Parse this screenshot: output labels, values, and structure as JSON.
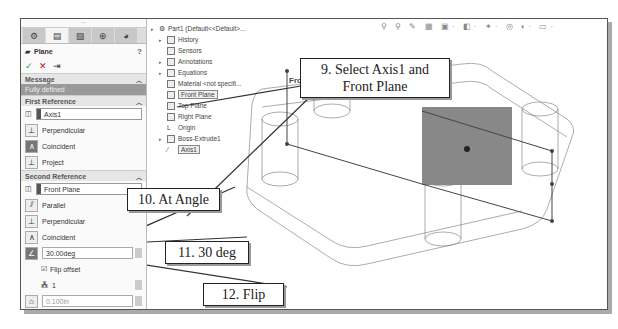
{
  "panel": {
    "tabs": [
      "feature-manager",
      "property-manager",
      "configuration-manager",
      "dimxpert",
      "display-manager"
    ],
    "title": "Plane",
    "help": "?",
    "actions": {
      "ok": "✓",
      "cancel": "✕",
      "pin": "⇥"
    },
    "message": {
      "header": "Message",
      "text": "Fully defined"
    },
    "first_reference": {
      "header": "First Reference",
      "selection": "Axis1",
      "options": [
        "Perpendicular",
        "Coincident",
        "Project"
      ]
    },
    "second_reference": {
      "header": "Second Reference",
      "selection": "Front Plane",
      "options": [
        "Parallel",
        "Perpendicular",
        "Coincident"
      ],
      "angle": "30.00deg",
      "flip_offset": "Flip offset",
      "instances": "1",
      "offset": "0.100in"
    }
  },
  "tree": {
    "root": "Part1  (Default<<Default>...",
    "items": [
      {
        "label": "History",
        "expand": true
      },
      {
        "label": "Sensors",
        "expand": false
      },
      {
        "label": "Annotations",
        "expand": true
      },
      {
        "label": "Equations",
        "expand": true
      },
      {
        "label": "Material <not specifi...",
        "expand": false
      },
      {
        "label": "Front Plane",
        "expand": false,
        "highlight": true
      },
      {
        "label": "Top Plane",
        "expand": false
      },
      {
        "label": "Right Plane",
        "expand": false
      },
      {
        "label": "Origin",
        "expand": false
      },
      {
        "label": "Boss-Extrude1",
        "expand": true
      },
      {
        "label": "Axis1",
        "expand": false,
        "highlight": true
      }
    ]
  },
  "toolbar": "⚲ ⚲ ✎ ▦ ▣· ◧· ✦· ◎ ◐· ▭·",
  "viewport": {
    "plane_label": "Front"
  },
  "callouts": {
    "c9": "9. Select Axis1 and Front Plane",
    "c10": "10. At Angle",
    "c11": "11. 30 deg",
    "c12": "12. Flip"
  }
}
